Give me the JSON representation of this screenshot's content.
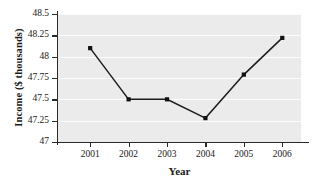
{
  "chart_data": {
    "type": "line",
    "title": "",
    "xlabel": "Year",
    "ylabel": "Income ($ thousands)",
    "categories": [
      "2001",
      "2002",
      "2003",
      "2004",
      "2005",
      "2006"
    ],
    "x": [
      2001,
      2002,
      2003,
      2004,
      2005,
      2006
    ],
    "values": [
      48.1,
      47.5,
      47.5,
      47.28,
      47.79,
      48.22
    ],
    "series": [
      {
        "name": "Income",
        "values": [
          48.1,
          47.5,
          47.5,
          47.28,
          47.79,
          48.22
        ]
      }
    ],
    "ylim": [
      47,
      48.5
    ],
    "yticks": [
      47,
      47.25,
      47.5,
      47.75,
      48,
      48.25,
      48.5
    ],
    "ytick_labels": [
      "47",
      "47.25",
      "47.5",
      "47.75",
      "48",
      "48.25",
      "48.5"
    ],
    "xtick_labels": [
      "2001",
      "2002",
      "2003",
      "2004",
      "2005",
      "2006"
    ],
    "grid": "horizontal",
    "legend": "none",
    "marker": "square",
    "colors": {
      "panel_background": "#ebebeb",
      "gridline": "#fdfdfd",
      "line": "#1c1c1c",
      "marker": "#111111",
      "axis": "#2b2b2b",
      "text": "#1a1a1a",
      "figure_background": "#ffffff"
    }
  }
}
